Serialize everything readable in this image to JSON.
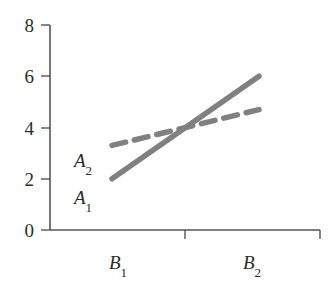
{
  "chart_data": {
    "type": "line",
    "title": "",
    "xlabel": "",
    "ylabel": "",
    "categories": [
      "B1",
      "B2"
    ],
    "x_tick_labels": [
      "B",
      "B"
    ],
    "x_tick_subscripts": [
      "1",
      "2"
    ],
    "y_tick_labels": [
      "0",
      "2",
      "4",
      "6",
      "8"
    ],
    "y_tick_values": [
      0,
      2,
      4,
      6,
      8
    ],
    "ylim": [
      0,
      8
    ],
    "grid": false,
    "legend": "inline-annotations",
    "series": [
      {
        "name": "A1",
        "label_base": "A",
        "label_subscript": "1",
        "style": "solid",
        "color": "#808080",
        "values": [
          2.0,
          6.0
        ]
      },
      {
        "name": "A2",
        "label_base": "A",
        "label_subscript": "2",
        "style": "dashed",
        "color": "#808080",
        "values": [
          3.3,
          4.7
        ]
      }
    ],
    "annotations": [
      {
        "text": "A2",
        "note": "upper series label, left of plot interior"
      },
      {
        "text": "A1",
        "note": "lower series label, left of plot interior"
      }
    ]
  },
  "axes": {
    "axis_color": "#555555",
    "background_color": "#ffffff"
  }
}
